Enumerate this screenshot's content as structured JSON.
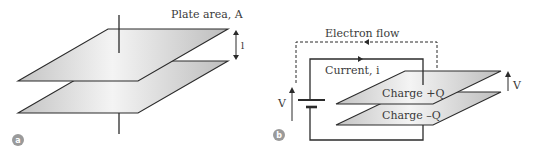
{
  "panel_a": {
    "badge": "a",
    "plate_area_label": "Plate area, A",
    "separation_label": "l"
  },
  "panel_b": {
    "badge": "b",
    "electron_flow_label": "Electron flow",
    "current_label": "Current, i",
    "battery_voltage_label": "V",
    "plate_voltage_label": "V",
    "top_plate_label": "Charge +Q",
    "bottom_plate_label": "Charge –Q"
  },
  "colors": {
    "line": "#2b2b2b",
    "plate_light": "#f2f2f2",
    "plate_dark": "#bdbdbd",
    "badge": "#9a9a9a",
    "text": "#3a3a3a"
  }
}
